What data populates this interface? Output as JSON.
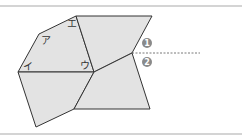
{
  "diagram": {
    "labels": {
      "a": "ア",
      "i": "イ",
      "u": "ウ",
      "e": "エ"
    },
    "markers": {
      "one": "1",
      "two": "2"
    },
    "colors": {
      "fill": "#e3e3e3",
      "stroke": "#333333",
      "marker": "#8a8a8a",
      "frame": "#d4d4d4"
    }
  }
}
